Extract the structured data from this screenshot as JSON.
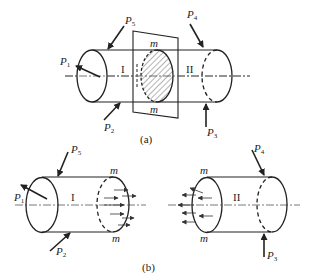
{
  "top_fragment": "",
  "figure_a": {
    "caption": "(a)",
    "loads": [
      {
        "id": "P1",
        "base": "P",
        "sub": "1"
      },
      {
        "id": "P2",
        "base": "P",
        "sub": "2"
      },
      {
        "id": "P3",
        "base": "P",
        "sub": "3"
      },
      {
        "id": "P4",
        "base": "P",
        "sub": "4"
      },
      {
        "id": "P5",
        "base": "P",
        "sub": "5"
      }
    ],
    "section_labels": {
      "top": "m",
      "bottom": "m"
    },
    "parts": {
      "left": "I",
      "right": "II"
    }
  },
  "figure_b": {
    "caption": "(b)",
    "left_part": {
      "name": "I",
      "loads": [
        {
          "id": "P1",
          "base": "P",
          "sub": "1"
        },
        {
          "id": "P2",
          "base": "P",
          "sub": "2"
        },
        {
          "id": "P5",
          "base": "P",
          "sub": "5"
        }
      ],
      "section_labels": {
        "top": "m",
        "bottom": "m"
      }
    },
    "right_part": {
      "name": "II",
      "loads": [
        {
          "id": "P3",
          "base": "P",
          "sub": "3"
        },
        {
          "id": "P4",
          "base": "P",
          "sub": "4"
        }
      ],
      "section_labels": {
        "top": "m",
        "bottom": "m"
      }
    }
  },
  "colors": {
    "ink": "#222222",
    "axis": "#555555",
    "background": "#ffffff"
  }
}
